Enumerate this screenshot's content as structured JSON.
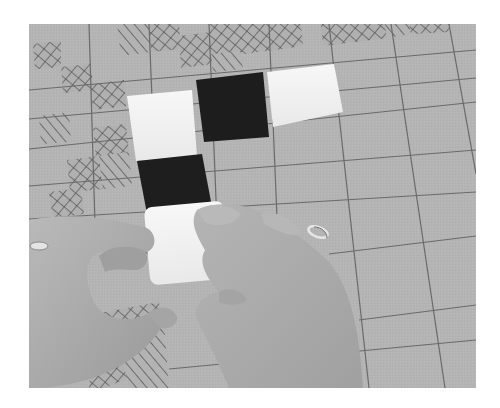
{
  "image": {
    "description": "Grayscale photograph of two hands placing square plastic tiles on a gray grid board partially covered by hatched cells",
    "palette": {
      "board": "#b3b3b3",
      "board_light": "#bdbdbd",
      "grid_line": "#6e6e6e",
      "hatch_line": "#4a4a4a",
      "tile_white": "#f3f3f3",
      "tile_black": "#1c1c1c",
      "skin": "#a9a9a9",
      "skin_shadow": "#8f8f8f",
      "background": "#ffffff"
    },
    "objects": [
      {
        "name": "tile-white-1",
        "color": "white",
        "position": "upper-left of row"
      },
      {
        "name": "tile-black-1",
        "color": "black",
        "position": "upper-middle of row"
      },
      {
        "name": "tile-white-2",
        "color": "white",
        "position": "upper-right of row"
      },
      {
        "name": "tile-black-2",
        "color": "black",
        "position": "below first white tile"
      },
      {
        "name": "tile-white-3",
        "color": "white",
        "position": "held by hands, bottom of column"
      },
      {
        "name": "left-hand",
        "detail": "wearing a ring"
      },
      {
        "name": "right-hand",
        "detail": "wearing a ring"
      }
    ],
    "caption": "Hands arranging black and white tiles on a grid board"
  }
}
